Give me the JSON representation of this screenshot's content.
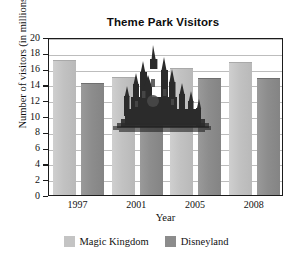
{
  "chart_data": {
    "type": "bar",
    "title": "Theme Park Visitors",
    "xlabel": "Year",
    "ylabel": "Number of visitors (in millions)",
    "categories": [
      "1997",
      "2001",
      "2005",
      "2008"
    ],
    "series": [
      {
        "name": "Magic Kingdom",
        "color": "#c4c4c4",
        "values": [
          17.0,
          14.8,
          15.9,
          16.7
        ]
      },
      {
        "name": "Disneyland",
        "color": "#8c8c8c",
        "values": [
          14.0,
          11.8,
          14.7,
          14.7
        ]
      }
    ],
    "ylim": [
      0,
      20
    ],
    "ytick_step": 2,
    "yticks": [
      0,
      2,
      4,
      6,
      8,
      10,
      12,
      14,
      16,
      18,
      20
    ],
    "grid": true,
    "legend_position": "bottom"
  },
  "decoration": {
    "castle_icon": "castle-silhouette"
  }
}
